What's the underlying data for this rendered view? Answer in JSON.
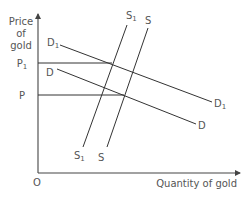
{
  "diagram": {
    "type": "supply-demand",
    "axes": {
      "y_label_lines": [
        "Price",
        "of",
        "gold"
      ],
      "x_label": "Quantity of gold",
      "origin_label": "O"
    },
    "price_levels": [
      {
        "label": "P",
        "sub": "1",
        "y": 63
      },
      {
        "label": "P",
        "sub": "",
        "y": 95
      }
    ],
    "curves": [
      {
        "name": "D1",
        "label": "D",
        "sub": "1",
        "kind": "demand"
      },
      {
        "name": "D",
        "label": "D",
        "sub": "",
        "kind": "demand"
      },
      {
        "name": "S1",
        "label": "S",
        "sub": "1",
        "kind": "supply"
      },
      {
        "name": "S",
        "label": "S",
        "sub": "",
        "kind": "supply"
      }
    ],
    "colors": {
      "line": "#333333",
      "text": "#555555",
      "background": "#ffffff"
    }
  }
}
